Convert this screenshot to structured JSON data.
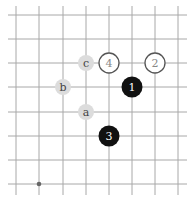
{
  "board": {
    "background": "#ffffff",
    "line_color": "#a8a8a8",
    "columns_x": [
      16,
      39,
      63,
      86,
      109,
      132,
      155,
      178
    ],
    "rows_y": [
      15,
      39,
      63,
      87,
      112,
      136,
      160,
      184
    ],
    "x_extent": [
      8,
      187
    ],
    "y_extent": [
      6,
      195
    ],
    "star_points": [
      {
        "col": 1,
        "row": 7
      }
    ]
  },
  "stones": [
    {
      "color": "black",
      "label": "1",
      "col": 5,
      "row": 3
    },
    {
      "color": "white",
      "label": "2",
      "col": 6,
      "row": 2
    },
    {
      "color": "black",
      "label": "3",
      "col": 4,
      "row": 5
    },
    {
      "color": "white",
      "label": "4",
      "col": 4,
      "row": 2
    }
  ],
  "markers": [
    {
      "label": "a",
      "col": 3,
      "row": 4
    },
    {
      "label": "b",
      "col": 2,
      "row": 3
    },
    {
      "label": "c",
      "col": 3,
      "row": 2
    }
  ],
  "colors": {
    "black_stone": "#111111",
    "black_text": "#ffffff",
    "white_stone": "#ffffff",
    "white_stroke": "#555555",
    "white_text": "#888888",
    "marker_fill": "#dcdcdc",
    "marker_text": "#444444"
  }
}
